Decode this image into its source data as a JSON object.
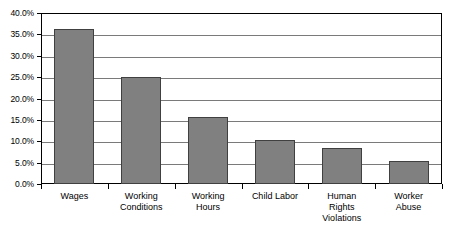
{
  "chart_data": {
    "type": "bar",
    "title": "",
    "xlabel": "",
    "ylabel": "",
    "categories": [
      "Wages",
      "Working Conditions",
      "Working Hours",
      "Child Labor",
      "Human Rights Violations",
      "Worker Abuse"
    ],
    "category_label_lines": [
      [
        "Wages"
      ],
      [
        "Working",
        "Conditions"
      ],
      [
        "Working",
        "Hours"
      ],
      [
        "Child Labor"
      ],
      [
        "Human",
        "Rights",
        "Violations"
      ],
      [
        "Worker",
        "Abuse"
      ]
    ],
    "values": [
      36.3,
      25.0,
      15.6,
      10.4,
      8.4,
      5.3
    ],
    "value_labels": [
      "36.3%",
      "25.0%",
      "15.6%",
      "10.4%",
      "8.4%",
      "5.3%"
    ],
    "ylim": [
      0,
      40
    ],
    "ytick_values": [
      40,
      35,
      30,
      25,
      20,
      15,
      10,
      5,
      0
    ],
    "ytick_labels": [
      "40.0%",
      "35.0%",
      "30.0%",
      "25.0%",
      "20.0%",
      "15.0%",
      "10.0%",
      "5.0%",
      "0.0%"
    ],
    "grid": true,
    "legend": false,
    "legend_position": "none",
    "bar_color": "#808080",
    "bar_border_color": "#404040",
    "gridline_color": "#7a7a7a",
    "frame_color": "#000000",
    "background_color": "#ffffff"
  }
}
